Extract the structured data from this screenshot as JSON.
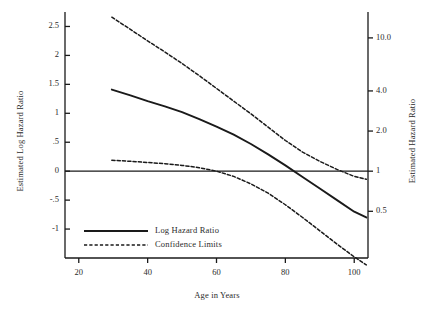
{
  "chart_data": {
    "type": "line",
    "title": "",
    "xlabel": "Age in Years",
    "ylabel": "Estimated Log Hazard Ratio",
    "ylabel_right": "Estimated Hazard Ratio",
    "xlim": [
      16,
      104
    ],
    "ylim": [
      -1.5,
      2.75
    ],
    "grid": false,
    "legend_position": "bottom-left",
    "x_ticks": [
      {
        "value": 20,
        "label": "20"
      },
      {
        "value": 40,
        "label": "40"
      },
      {
        "value": 60,
        "label": "60"
      },
      {
        "value": 80,
        "label": "80"
      },
      {
        "value": 100,
        "label": "100"
      }
    ],
    "y_ticks_left": [
      {
        "value": 2.5,
        "label": "2.5"
      },
      {
        "value": 2.0,
        "label": "2"
      },
      {
        "value": 1.5,
        "label": "1.5"
      },
      {
        "value": 1.0,
        "label": "1"
      },
      {
        "value": 0.5,
        "label": ".5"
      },
      {
        "value": 0.0,
        "label": "0"
      },
      {
        "value": -0.5,
        "label": "-.5"
      },
      {
        "value": -1.0,
        "label": "-1"
      }
    ],
    "y_ticks_right": [
      {
        "value": 2.3026,
        "label": "10.0"
      },
      {
        "value": 1.3863,
        "label": "4.0"
      },
      {
        "value": 0.6931,
        "label": "2.0"
      },
      {
        "value": 0.0,
        "label": "1"
      },
      {
        "value": -0.6931,
        "label": "0.5"
      }
    ],
    "reference_line": {
      "value": 0.0,
      "orientation": "horizontal"
    },
    "series": [
      {
        "name": "Log Hazard Ratio",
        "style": "solid",
        "color": "#1a1a1a",
        "x": [
          29.6,
          35,
          40,
          45,
          50,
          55,
          60,
          65,
          70,
          75,
          80,
          85,
          90,
          95,
          100,
          103.5
        ],
        "y": [
          1.41,
          1.31,
          1.21,
          1.12,
          1.02,
          0.9,
          0.77,
          0.63,
          0.47,
          0.29,
          0.1,
          -0.1,
          -0.3,
          -0.5,
          -0.7,
          -0.8
        ]
      },
      {
        "name": "Upper Confidence Limit",
        "style": "dashed",
        "color": "#1a1a1a",
        "x": [
          29.6,
          35,
          40,
          45,
          50,
          55,
          60,
          65,
          70,
          75,
          80,
          85,
          90,
          95,
          100,
          103.5
        ],
        "y": [
          2.66,
          2.45,
          2.25,
          2.06,
          1.86,
          1.65,
          1.43,
          1.21,
          0.99,
          0.76,
          0.53,
          0.33,
          0.17,
          0.03,
          -0.09,
          -0.14
        ]
      },
      {
        "name": "Lower Confidence Limit",
        "style": "dashed",
        "color": "#1a1a1a",
        "x": [
          29.6,
          35,
          40,
          45,
          50,
          55,
          60,
          65,
          70,
          75,
          80,
          85,
          90,
          95,
          100,
          103.5
        ],
        "y": [
          0.19,
          0.17,
          0.15,
          0.13,
          0.1,
          0.06,
          0.0,
          -0.09,
          -0.22,
          -0.38,
          -0.58,
          -0.8,
          -1.03,
          -1.26,
          -1.48,
          -1.62
        ]
      }
    ]
  },
  "axes": {
    "left_title": "Estimated Log Hazard Ratio",
    "right_title": "Estimated Hazard Ratio",
    "bottom_title": "Age in Years"
  },
  "legend": {
    "entries": [
      {
        "label": "Log Hazard Ratio",
        "style": "solid"
      },
      {
        "label": "Confidence Limits",
        "style": "dashed"
      }
    ]
  }
}
